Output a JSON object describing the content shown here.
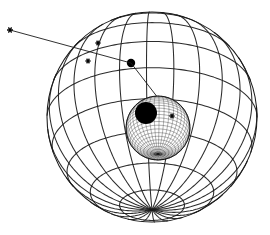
{
  "figure": {
    "title": "",
    "caption": "",
    "background_color": "#ffffff",
    "line_color": "#1a1a1a",
    "fill_color": "#000000",
    "width": 270,
    "height": 235
  },
  "chart_data": {
    "type": "scatter",
    "title": "",
    "subtitle": "",
    "xlabel": "",
    "ylabel": "",
    "grid": true,
    "legend_position": "none",
    "objects": [
      {
        "name": "outer-sphere",
        "kind": "wireframe-sphere",
        "center": [
          152,
          117
        ],
        "radius": 105,
        "meridian_count": 24,
        "parallel_count": 9,
        "pole_screen_position": [
          131,
          63
        ],
        "tilt_degrees": 62,
        "rotation_degrees": -12,
        "stroke_width": 1.05,
        "shaded": false
      },
      {
        "name": "inner-sphere",
        "kind": "dense-mesh-sphere",
        "center": [
          158,
          128
        ],
        "radius": 32,
        "meridian_count": 40,
        "parallel_count": 26,
        "pole_screen_position": [
          146,
          113
        ],
        "pole_cap_radius": 11,
        "tilt_degrees": 55,
        "rotation_degrees": -20,
        "stroke_width": 0.38,
        "shaded": true
      }
    ],
    "ray": {
      "name": "incident-ray",
      "points": [
        [
          10,
          30
        ],
        [
          131,
          63
        ],
        [
          172,
          116
        ]
      ],
      "stroke_width": 0.9,
      "arrowhead": false
    },
    "markers": [
      {
        "label": "",
        "symbol": "star",
        "x": 10,
        "y": 30,
        "size": 6.0
      },
      {
        "label": "",
        "symbol": "star",
        "x": 98,
        "y": 43,
        "size": 5.0
      },
      {
        "label": "",
        "symbol": "star",
        "x": 88,
        "y": 61,
        "size": 5.0
      },
      {
        "label": "",
        "symbol": "star",
        "x": 172,
        "y": 116,
        "size": 5.0
      }
    ],
    "x": [
      10,
      98,
      88,
      131,
      172
    ],
    "y": [
      30,
      43,
      61,
      63,
      116
    ],
    "values": [],
    "categories": []
  }
}
